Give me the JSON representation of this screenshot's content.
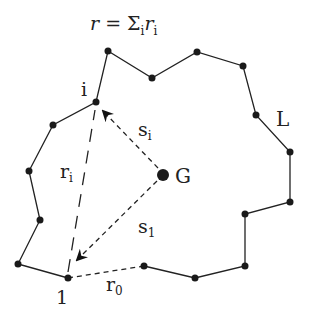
{
  "figure": {
    "formula": {
      "r": "r",
      "eq": " = ",
      "sigma": "Σ",
      "sub_i": "i",
      "ri": "r",
      "ri_sub": "i"
    },
    "labels": {
      "vertex_i": "i",
      "vertex_1": "1",
      "centroid": "G",
      "contour": "L",
      "s_i": "s",
      "s_i_sub": "i",
      "s_1": "s",
      "s_1_sub": "1",
      "r_i": "r",
      "r_i_sub": "i",
      "r_0": "r",
      "r_0_sub": "0"
    },
    "polygon_vertices": [
      [
        68,
        278
      ],
      [
        18,
        264
      ],
      [
        40,
        220
      ],
      [
        29,
        171
      ],
      [
        53,
        125
      ],
      [
        96,
        102
      ],
      [
        108,
        51
      ],
      [
        152,
        78
      ],
      [
        197,
        52
      ],
      [
        243,
        66
      ],
      [
        256,
        115
      ],
      [
        290,
        152
      ],
      [
        290,
        202
      ],
      [
        245,
        214
      ],
      [
        245,
        266
      ],
      [
        195,
        278
      ],
      [
        144,
        266
      ]
    ],
    "centroid": [
      163,
      175
    ],
    "colors": {
      "ink": "#222222",
      "background": "#ffffff"
    }
  }
}
